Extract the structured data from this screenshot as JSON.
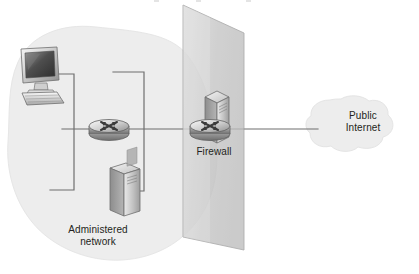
{
  "figure": {
    "type": "network-architecture-diagram",
    "title": "",
    "background_color": "#ffffff"
  },
  "zones": {
    "administered_network": {
      "label": "Administered\nnetwork",
      "shape": "blob",
      "fill_color": "#ededed",
      "stroke_color": "#e3e3e3"
    },
    "public_internet": {
      "label": "Public\nInternet",
      "shape": "cloud",
      "fill_color": "#ededed",
      "stroke_color": "#e0e0e0"
    }
  },
  "firewall": {
    "label": "Firewall",
    "shape": "translucent-plane",
    "fill_color": "#c9c9c9",
    "stroke_color": "#9a9a9a"
  },
  "nodes": [
    {
      "id": "workstation",
      "icon": "desktop-computer-icon",
      "label": "",
      "zone": "administered_network"
    },
    {
      "id": "internal-router",
      "icon": "router-icon",
      "label": "",
      "zone": "administered_network"
    },
    {
      "id": "internal-server",
      "icon": "server-tower-icon",
      "label": "",
      "zone": "administered_network"
    },
    {
      "id": "firewall-server",
      "icon": "server-tower-icon",
      "label": "",
      "zone": "firewall"
    },
    {
      "id": "firewall-router",
      "icon": "router-icon",
      "label": "Firewall",
      "zone": "firewall"
    }
  ],
  "links": [
    {
      "from": "workstation",
      "to": "internal-router",
      "style": "orthogonal"
    },
    {
      "from": "internal-server",
      "to": "internal-router",
      "style": "orthogonal"
    },
    {
      "from": "internal-router",
      "to": "firewall-router",
      "style": "straight"
    },
    {
      "from": "firewall-router",
      "to": "public_internet",
      "style": "straight"
    }
  ],
  "colors": {
    "line": "#6f6f6f",
    "text": "#231f20",
    "zone_fill": "#ededed",
    "plane_fill": "#c9c9c9",
    "device_light": "#f2f2f2",
    "device_mid": "#b8b8b8",
    "device_dark": "#6a6a6a"
  }
}
